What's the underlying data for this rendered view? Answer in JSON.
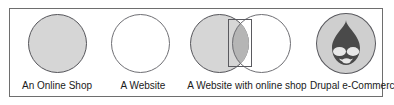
{
  "diagram": {
    "frame_border_color": "#6e6e6e",
    "background_color": "#ffffff",
    "shaded_fill_color": "#d6d6d6",
    "intersection_fill_color": "#b5b5b5",
    "circle_stroke_color": "#55555a",
    "logo_fill_color": "#4a4a4a",
    "cells": [
      {
        "id": "an-online-shop",
        "caption": "An Online Shop",
        "circles": [
          {
            "role": "shop",
            "fill": "shaded"
          }
        ],
        "highlight_rect": false,
        "logo": null
      },
      {
        "id": "a-website",
        "caption": "A Website",
        "circles": [
          {
            "role": "website",
            "fill": "hollow"
          }
        ],
        "highlight_rect": false,
        "logo": null
      },
      {
        "id": "a-website-with-online-shop",
        "caption": "A Website with online shop",
        "circles": [
          {
            "role": "shop",
            "fill": "shaded"
          },
          {
            "role": "website",
            "fill": "hollow"
          }
        ],
        "highlight_rect": true,
        "logo": null
      },
      {
        "id": "drupal-e-commerce",
        "caption": "Drupal e-Commerce",
        "circles": [
          {
            "role": "drupal",
            "fill": "shaded"
          }
        ],
        "highlight_rect": false,
        "logo": "drupal-droplet-icon"
      }
    ]
  }
}
